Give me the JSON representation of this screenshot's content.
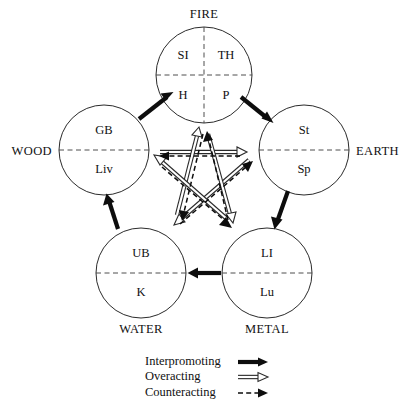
{
  "figure": {
    "colors": {
      "line": "#0d0d0d",
      "circle_stroke": "#2b2b2b",
      "divider": "#3a3a3a",
      "background": "#ffffff"
    }
  },
  "elements": [
    {
      "id": "fire",
      "label": "FIRE",
      "label_position": "top",
      "quadrants": true,
      "organs": {
        "top_left": "SI",
        "top_right": "TH",
        "bottom_left": "H",
        "bottom_right": "P"
      }
    },
    {
      "id": "wood",
      "label": "WOOD",
      "label_position": "left",
      "quadrants": false,
      "organs": {
        "top": "GB",
        "bottom": "Liv"
      }
    },
    {
      "id": "earth",
      "label": "EARTH",
      "label_position": "right",
      "quadrants": false,
      "organs": {
        "top": "St",
        "bottom": "Sp"
      }
    },
    {
      "id": "water",
      "label": "WATER",
      "label_position": "bottom",
      "quadrants": false,
      "organs": {
        "top": "UB",
        "bottom": "K"
      }
    },
    {
      "id": "metal",
      "label": "METAL",
      "label_position": "bottom",
      "quadrants": false,
      "organs": {
        "top": "LI",
        "bottom": "Lu"
      }
    }
  ],
  "relations": {
    "interpromoting": [
      {
        "from": "wood",
        "to": "fire"
      },
      {
        "from": "fire",
        "to": "earth"
      },
      {
        "from": "earth",
        "to": "metal"
      },
      {
        "from": "metal",
        "to": "water"
      },
      {
        "from": "water",
        "to": "wood"
      }
    ],
    "overacting": [
      {
        "from": "wood",
        "to": "earth"
      },
      {
        "from": "earth",
        "to": "water"
      },
      {
        "from": "water",
        "to": "fire"
      },
      {
        "from": "fire",
        "to": "metal"
      },
      {
        "from": "metal",
        "to": "wood"
      }
    ],
    "counteracting": [
      {
        "from": "earth",
        "to": "wood"
      },
      {
        "from": "water",
        "to": "earth"
      },
      {
        "from": "fire",
        "to": "water"
      },
      {
        "from": "metal",
        "to": "fire"
      },
      {
        "from": "wood",
        "to": "metal"
      }
    ]
  },
  "legend": {
    "items": [
      {
        "label": "Interpromoting",
        "style": "solid-thick-arrow"
      },
      {
        "label": "Overacting",
        "style": "hollow-double-line-arrow"
      },
      {
        "label": "Counteracting",
        "style": "dashed-arrow"
      }
    ]
  }
}
